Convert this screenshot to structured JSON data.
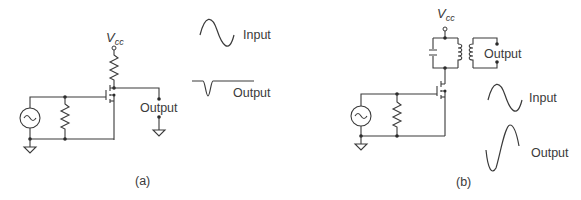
{
  "figure": {
    "panels": [
      {
        "id": "a",
        "caption": "(a)",
        "supply_label": "V",
        "supply_subscript": "cc",
        "output_terminal_label": "Output",
        "load": "resistor",
        "waveforms": [
          {
            "label": "Input",
            "shape": "sine"
          },
          {
            "label": "Output",
            "shape": "negative-pulse"
          }
        ]
      },
      {
        "id": "b",
        "caption": "(b)",
        "supply_label": "V",
        "supply_subscript": "cc",
        "output_terminal_label": "Output",
        "load": "tuned-LC-transformer",
        "waveforms": [
          {
            "label": "Input",
            "shape": "sine"
          },
          {
            "label": "Output",
            "shape": "amplified-sine"
          }
        ]
      }
    ]
  }
}
